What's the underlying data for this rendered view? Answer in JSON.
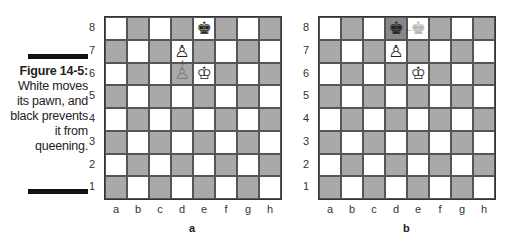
{
  "caption": {
    "figure": "Figure 14-5:",
    "text": "White moves its pawn, and black prevents it from queening."
  },
  "files": [
    "a",
    "b",
    "c",
    "d",
    "e",
    "f",
    "g",
    "h"
  ],
  "ranks": [
    "8",
    "7",
    "6",
    "5",
    "4",
    "3",
    "2",
    "1"
  ],
  "colors": {
    "light": "#ffffff",
    "dark": "#a9a9a9",
    "border": "#333333"
  },
  "boards": [
    {
      "label": "a",
      "pieces": [
        {
          "square": "e8",
          "glyph": "♚",
          "name": "black-king"
        },
        {
          "square": "d7",
          "glyph": "♙",
          "name": "white-pawn"
        },
        {
          "square": "d6",
          "glyph": "♙",
          "name": "white-pawn-origin",
          "ghost": true
        },
        {
          "square": "e6",
          "glyph": "♔",
          "name": "white-king"
        }
      ],
      "highlight_light": [
        "e8",
        "d7",
        "e6"
      ],
      "arrow": {
        "from": "d6",
        "to": "d7",
        "glyph": "↑"
      }
    },
    {
      "label": "b",
      "pieces": [
        {
          "square": "d8",
          "glyph": "♚",
          "name": "black-king"
        },
        {
          "square": "e8",
          "glyph": "♚",
          "name": "black-king-origin",
          "ghost": true
        },
        {
          "square": "d7",
          "glyph": "♙",
          "name": "white-pawn"
        },
        {
          "square": "e6",
          "glyph": "♔",
          "name": "white-king"
        }
      ],
      "highlight_light": [
        "d7",
        "e6",
        "e8"
      ],
      "highlight_dark": [
        "d8"
      ],
      "arrow": {
        "from": "e8",
        "to": "d8",
        "glyph": "←"
      }
    }
  ]
}
